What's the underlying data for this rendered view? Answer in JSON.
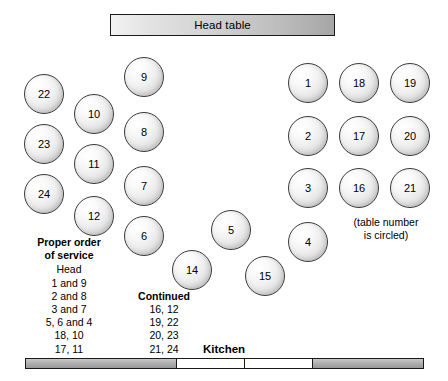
{
  "head_table": {
    "label": "Head table"
  },
  "kitchen": {
    "label": "Kitchen",
    "segments": [
      {
        "type": "wall",
        "width": 152
      },
      {
        "type": "door",
        "width": 69
      },
      {
        "type": "door",
        "width": 69
      },
      {
        "type": "wall",
        "width": 112
      }
    ]
  },
  "note": {
    "line1": "(table number",
    "line2": "is circled)"
  },
  "legend": {
    "title_line1": "Proper order",
    "title_line2": "of service",
    "left_rows": [
      "Head",
      "1 and 9",
      "2 and 8",
      "3 and 7",
      "5, 6 and 4",
      "18, 10",
      "17, 11"
    ],
    "right_heading": "Continued",
    "right_rows": [
      "16, 12",
      "19, 22",
      "20, 23",
      "21, 24",
      "14, 15"
    ]
  },
  "tables": [
    {
      "number": "22",
      "x": 24,
      "y": 74
    },
    {
      "number": "23",
      "x": 24,
      "y": 124
    },
    {
      "number": "24",
      "x": 24,
      "y": 174
    },
    {
      "number": "10",
      "x": 74,
      "y": 94
    },
    {
      "number": "11",
      "x": 74,
      "y": 144
    },
    {
      "number": "12",
      "x": 74,
      "y": 196
    },
    {
      "number": "9",
      "x": 124,
      "y": 57
    },
    {
      "number": "8",
      "x": 124,
      "y": 112
    },
    {
      "number": "7",
      "x": 124,
      "y": 166
    },
    {
      "number": "6",
      "x": 124,
      "y": 216
    },
    {
      "number": "14",
      "x": 172,
      "y": 250
    },
    {
      "number": "5",
      "x": 211,
      "y": 210
    },
    {
      "number": "15",
      "x": 245,
      "y": 256
    },
    {
      "number": "1",
      "x": 288,
      "y": 63
    },
    {
      "number": "2",
      "x": 288,
      "y": 116
    },
    {
      "number": "3",
      "x": 288,
      "y": 168
    },
    {
      "number": "4",
      "x": 288,
      "y": 222
    },
    {
      "number": "18",
      "x": 339,
      "y": 63
    },
    {
      "number": "17",
      "x": 339,
      "y": 116
    },
    {
      "number": "16",
      "x": 339,
      "y": 168
    },
    {
      "number": "19",
      "x": 390,
      "y": 63
    },
    {
      "number": "20",
      "x": 390,
      "y": 116
    },
    {
      "number": "21",
      "x": 390,
      "y": 168
    }
  ]
}
